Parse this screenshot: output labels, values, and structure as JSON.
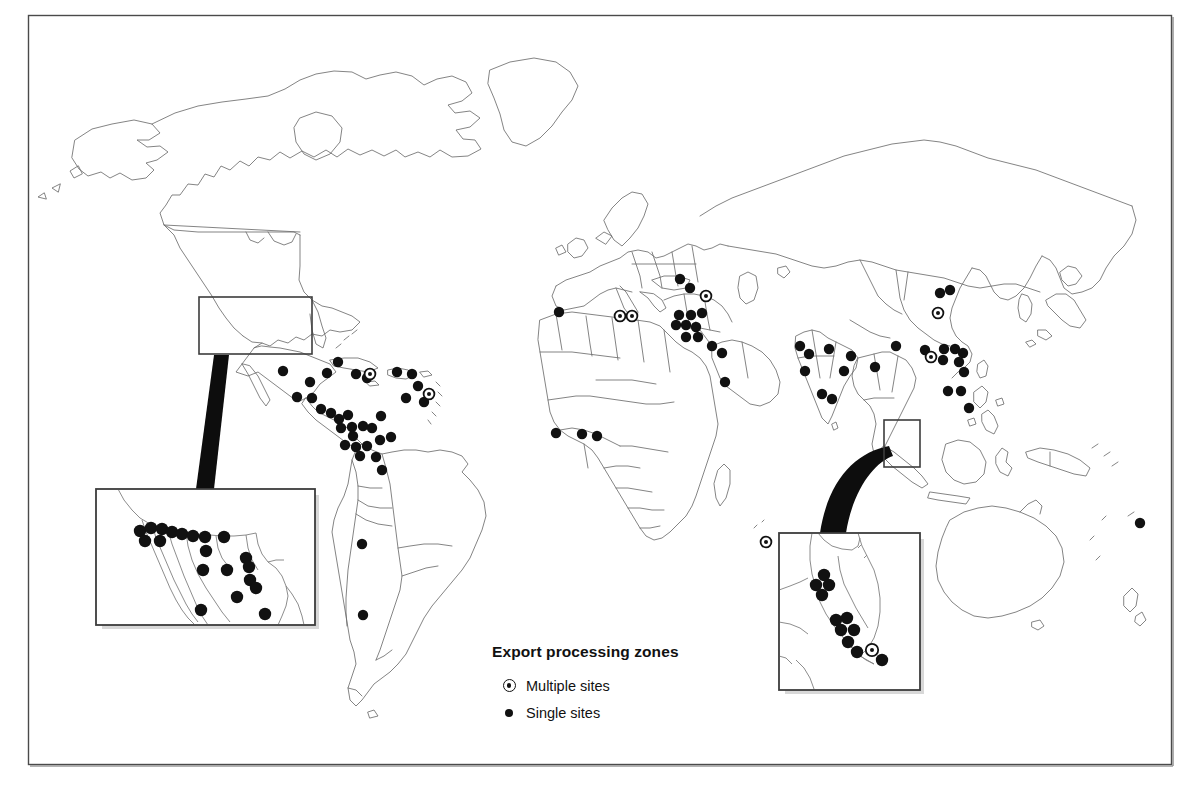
{
  "figure": {
    "kind": "world-map",
    "frame": {
      "x": 28,
      "y": 15,
      "width": 1144,
      "height": 750,
      "border_color": "#4a4a4a"
    },
    "background": "#ffffff",
    "land_outline_color": "#6e6e6e",
    "marker_color": "#111111"
  },
  "legend": {
    "title": "Export processing zones",
    "items": [
      {
        "symbol": "multiple-sites-icon",
        "label": "Multiple sites"
      },
      {
        "symbol": "single-sites-icon",
        "label": "Single sites"
      }
    ]
  },
  "caption_remnant": "",
  "insets": [
    {
      "id": "mexico-border",
      "name": "mexico-us-border-inset",
      "source_box": {
        "x": 199,
        "y": 297,
        "width": 113,
        "height": 57
      },
      "panel": {
        "x": 96,
        "y": 489,
        "width": 219,
        "height": 136
      },
      "shadow": true,
      "markers_single": [
        [
          140,
          531
        ],
        [
          151,
          528
        ],
        [
          162,
          529
        ],
        [
          172,
          532
        ],
        [
          182,
          534
        ],
        [
          193,
          536
        ],
        [
          145,
          541
        ],
        [
          160,
          541
        ],
        [
          205,
          537
        ],
        [
          224,
          537
        ],
        [
          206,
          551
        ],
        [
          246,
          558
        ],
        [
          249,
          567
        ],
        [
          203,
          570
        ],
        [
          227,
          570
        ],
        [
          250,
          580
        ],
        [
          256,
          588
        ],
        [
          237,
          597
        ],
        [
          201,
          610
        ],
        [
          265,
          614
        ]
      ],
      "markers_multiple": []
    },
    {
      "id": "malaysia-singapore",
      "name": "malaysia-singapore-inset",
      "source_box": {
        "x": 884,
        "y": 420,
        "width": 36,
        "height": 47
      },
      "panel": {
        "x": 779,
        "y": 533,
        "width": 141,
        "height": 157
      },
      "shadow": true,
      "markers_single": [
        [
          824,
          575
        ],
        [
          816,
          585
        ],
        [
          829,
          585
        ],
        [
          822,
          595
        ],
        [
          836,
          620
        ],
        [
          847,
          618
        ],
        [
          841,
          630
        ],
        [
          854,
          630
        ],
        [
          848,
          642
        ],
        [
          857,
          652
        ],
        [
          882,
          660
        ]
      ],
      "markers_multiple": [
        [
          872,
          650
        ]
      ]
    }
  ],
  "map_markers": {
    "single": [
      [
        283,
        371
      ],
      [
        310,
        382
      ],
      [
        297,
        397
      ],
      [
        312,
        398
      ],
      [
        321,
        409
      ],
      [
        331,
        413
      ],
      [
        339,
        419
      ],
      [
        348,
        415
      ],
      [
        352,
        427
      ],
      [
        353,
        436
      ],
      [
        341,
        428
      ],
      [
        363,
        426
      ],
      [
        372,
        428
      ],
      [
        381,
        416
      ],
      [
        345,
        445
      ],
      [
        356,
        447
      ],
      [
        367,
        446
      ],
      [
        380,
        440
      ],
      [
        391,
        437
      ],
      [
        360,
        456
      ],
      [
        376,
        457
      ],
      [
        327,
        373
      ],
      [
        338,
        362
      ],
      [
        356,
        374
      ],
      [
        367,
        378
      ],
      [
        397,
        372
      ],
      [
        412,
        374
      ],
      [
        418,
        386
      ],
      [
        406,
        398
      ],
      [
        424,
        402
      ],
      [
        382,
        470
      ],
      [
        362,
        544
      ],
      [
        363,
        615
      ],
      [
        559,
        312
      ],
      [
        556,
        433
      ],
      [
        582,
        434
      ],
      [
        597,
        436
      ],
      [
        680,
        279
      ],
      [
        690,
        288
      ],
      [
        679,
        315
      ],
      [
        691,
        315
      ],
      [
        702,
        313
      ],
      [
        676,
        325
      ],
      [
        686,
        325
      ],
      [
        696,
        327
      ],
      [
        686,
        337
      ],
      [
        698,
        337
      ],
      [
        712,
        346
      ],
      [
        722,
        353
      ],
      [
        725,
        382
      ],
      [
        800,
        346
      ],
      [
        809,
        354
      ],
      [
        805,
        371
      ],
      [
        829,
        349
      ],
      [
        822,
        394
      ],
      [
        832,
        399
      ],
      [
        844,
        371
      ],
      [
        851,
        356
      ],
      [
        875,
        367
      ],
      [
        896,
        346
      ],
      [
        940,
        293
      ],
      [
        950,
        290
      ],
      [
        925,
        350
      ],
      [
        944,
        349
      ],
      [
        955,
        349
      ],
      [
        963,
        353
      ],
      [
        943,
        360
      ],
      [
        959,
        362
      ],
      [
        964,
        372
      ],
      [
        948,
        391
      ],
      [
        961,
        391
      ],
      [
        969,
        408
      ],
      [
        1140,
        523
      ]
    ],
    "multiple": [
      [
        370,
        374
      ],
      [
        429,
        394
      ],
      [
        620,
        316
      ],
      [
        632,
        316
      ],
      [
        706,
        296
      ],
      [
        766,
        542
      ],
      [
        938,
        313
      ],
      [
        931,
        357
      ]
    ]
  },
  "connectors": [
    {
      "id": "mexico-connector",
      "from": [
        221,
        356
      ],
      "to": [
        205,
        489
      ],
      "style": "tapered-wedge"
    },
    {
      "id": "asia-connector",
      "from": [
        887,
        452
      ],
      "to": [
        835,
        533
      ],
      "style": "tapered-curve"
    }
  ]
}
